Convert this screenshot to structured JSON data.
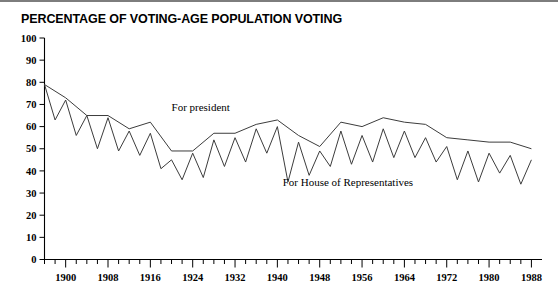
{
  "title": "PERCENTAGE OF VOTING-AGE POPULATION VOTING",
  "annotations": {
    "president": "For president",
    "house": "For House of Representatives"
  },
  "colors": {
    "line": "#3c3c3c",
    "axis": "#000000",
    "top_rule": "#7d7d7d",
    "background": "#ffffff"
  },
  "chart_data": {
    "type": "line",
    "title": "PERCENTAGE OF VOTING-AGE POPULATION VOTING",
    "xlabel": "",
    "ylabel": "",
    "xlim": [
      1896,
      1990
    ],
    "ylim": [
      0,
      100
    ],
    "ytick_step": 10,
    "xtick_step": 2,
    "xlabel_step": 8,
    "grid": false,
    "legend": "inline-annotations",
    "yticks": [
      0,
      10,
      20,
      30,
      40,
      50,
      60,
      70,
      80,
      90,
      100
    ],
    "ytick_labels": [
      "0",
      "10",
      "20",
      "30",
      "40",
      "50",
      "60",
      "70",
      "80",
      "90",
      "100"
    ],
    "xticks": [
      1896,
      1898,
      1900,
      1902,
      1904,
      1906,
      1908,
      1910,
      1912,
      1914,
      1916,
      1918,
      1920,
      1922,
      1924,
      1926,
      1928,
      1930,
      1932,
      1934,
      1936,
      1938,
      1940,
      1942,
      1944,
      1946,
      1948,
      1950,
      1952,
      1954,
      1956,
      1958,
      1960,
      1962,
      1964,
      1966,
      1968,
      1970,
      1972,
      1974,
      1976,
      1978,
      1980,
      1982,
      1984,
      1986,
      1988
    ],
    "xtick_labels": [
      "1900",
      "1908",
      "1916",
      "1924",
      "1932",
      "1940",
      "1948",
      "1956",
      "1964",
      "1972",
      "1980",
      "1988"
    ],
    "xtick_label_values": [
      1900,
      1908,
      1916,
      1924,
      1932,
      1940,
      1948,
      1956,
      1964,
      1972,
      1980,
      1988
    ],
    "series": [
      {
        "name": "For president",
        "label_x": 1920,
        "label_y": 67,
        "x": [
          1896,
          1900,
          1904,
          1908,
          1912,
          1916,
          1920,
          1924,
          1928,
          1932,
          1936,
          1940,
          1944,
          1948,
          1952,
          1956,
          1960,
          1964,
          1968,
          1972,
          1976,
          1980,
          1984,
          1988
        ],
        "values": [
          79,
          73,
          65,
          65,
          59,
          62,
          49,
          49,
          57,
          57,
          61,
          63,
          56,
          51,
          62,
          60,
          64,
          62,
          61,
          55,
          54,
          53,
          53,
          50
        ]
      },
      {
        "name": "For House of Representatives",
        "label_x": 1941,
        "label_y": 33,
        "x": [
          1896,
          1898,
          1900,
          1902,
          1904,
          1906,
          1908,
          1910,
          1912,
          1914,
          1916,
          1918,
          1920,
          1922,
          1924,
          1926,
          1928,
          1930,
          1932,
          1934,
          1936,
          1938,
          1940,
          1942,
          1944,
          1946,
          1948,
          1950,
          1952,
          1954,
          1956,
          1958,
          1960,
          1962,
          1964,
          1966,
          1968,
          1970,
          1972,
          1974,
          1976,
          1978,
          1980,
          1982,
          1984,
          1986,
          1988
        ],
        "values": [
          79,
          63,
          72,
          56,
          65,
          50,
          64,
          49,
          58,
          47,
          57,
          41,
          45,
          36,
          48,
          37,
          54,
          42,
          55,
          44,
          59,
          48,
          60,
          35,
          53,
          38,
          49,
          42,
          58,
          43,
          56,
          44,
          59,
          46,
          58,
          46,
          55,
          44,
          51,
          36,
          49,
          35,
          48,
          39,
          47,
          34,
          45
        ]
      }
    ]
  }
}
